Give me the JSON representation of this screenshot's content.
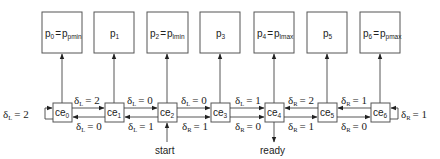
{
  "diagram": {
    "pe_boxes": [
      {
        "id": "p0",
        "base": "p",
        "sub": "0",
        "eq": "=",
        "rhs_base": "p",
        "rhs_sub": "pmin"
      },
      {
        "id": "p1",
        "base": "p",
        "sub": "1"
      },
      {
        "id": "p2",
        "base": "p",
        "sub": "2",
        "eq": "=",
        "rhs_base": "p",
        "rhs_sub": "lmin"
      },
      {
        "id": "p3",
        "base": "p",
        "sub": "3"
      },
      {
        "id": "p4",
        "base": "p",
        "sub": "4",
        "eq": "=",
        "rhs_base": "p",
        "rhs_sub": "lmax"
      },
      {
        "id": "p5",
        "base": "p",
        "sub": "5"
      },
      {
        "id": "p6",
        "base": "p",
        "sub": "6",
        "eq": "=",
        "rhs_base": "p",
        "rhs_sub": "pmax"
      }
    ],
    "ce_boxes": [
      {
        "base": "ce",
        "sub": "0"
      },
      {
        "base": "ce",
        "sub": "1"
      },
      {
        "base": "ce",
        "sub": "2"
      },
      {
        "base": "ce",
        "sub": "3"
      },
      {
        "base": "ce",
        "sub": "4"
      },
      {
        "base": "ce",
        "sub": "5"
      },
      {
        "base": "ce",
        "sub": "6"
      }
    ],
    "top_labels": [
      {
        "sym": "δ",
        "sub": "L",
        "val": "= 2"
      },
      {
        "sym": "δ",
        "sub": "L",
        "val": "= 0"
      },
      {
        "sym": "δ",
        "sub": "L",
        "val": "= 0"
      },
      {
        "sym": "δ",
        "sub": "L",
        "val": "= 1"
      },
      {
        "sym": "δ",
        "sub": "R",
        "val": "= 2"
      },
      {
        "sym": "δ",
        "sub": "R",
        "val": "= 1"
      }
    ],
    "bottom_labels": [
      {
        "sym": "δ",
        "sub": "L",
        "val": "= 0"
      },
      {
        "sym": "δ",
        "sub": "L",
        "val": "= 1"
      },
      {
        "sym": "δ",
        "sub": "R",
        "val": "= 1"
      },
      {
        "sym": "δ",
        "sub": "R",
        "val": "= 0"
      },
      {
        "sym": "δ",
        "sub": "R",
        "val": "= 1"
      },
      {
        "sym": "δ",
        "sub": "R",
        "val": "= 0"
      }
    ],
    "left_self_loop": {
      "sym": "δ",
      "sub": "L",
      "val": "= 2"
    },
    "right_self_loop": {
      "sym": "δ",
      "sub": "R",
      "val": "= 1"
    },
    "start_label": "start",
    "ready_label": "ready"
  }
}
